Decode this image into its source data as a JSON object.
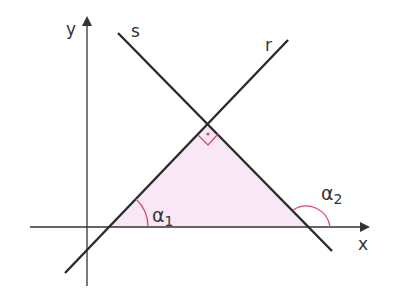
{
  "diagram": {
    "axes": {
      "x_label": "x",
      "y_label": "y"
    },
    "lines": [
      {
        "name": "r",
        "label": "r"
      },
      {
        "name": "s",
        "label": "s"
      }
    ],
    "angles": [
      {
        "name": "alpha1",
        "symbol": "α",
        "subscript": "1"
      },
      {
        "name": "alpha2",
        "symbol": "α",
        "subscript": "2"
      }
    ],
    "right_angle_marker": "·",
    "colors": {
      "line": "#2a2a2a",
      "fill": "#f8e8f6",
      "angle_arc": "#e0457a"
    }
  }
}
